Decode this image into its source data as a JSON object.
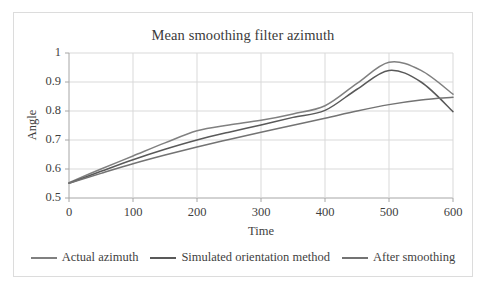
{
  "chart_data": {
    "type": "line",
    "title": "Mean smoothing filter azimuth",
    "xlabel": "Time",
    "ylabel": "Angle",
    "xlim": [
      0,
      600
    ],
    "ylim": [
      0.5,
      1
    ],
    "xticks": [
      "0",
      "100",
      "200",
      "300",
      "400",
      "500",
      "600"
    ],
    "yticks": [
      "0.5",
      "0.6",
      "0.7",
      "0.8",
      "0.9",
      "1"
    ],
    "grid": "horizontal-and-vertical",
    "legend_position": "bottom",
    "x": [
      0,
      50,
      100,
      150,
      200,
      250,
      300,
      350,
      400,
      450,
      500,
      550,
      600
    ],
    "series": [
      {
        "name": "Actual azimuth",
        "color": "#808080",
        "values": [
          0.553,
          0.6,
          0.645,
          0.69,
          0.732,
          0.752,
          0.768,
          0.79,
          0.818,
          0.895,
          0.968,
          0.94,
          0.858
        ]
      },
      {
        "name": "Simulated orientation method",
        "color": "#595959",
        "values": [
          0.551,
          0.592,
          0.632,
          0.668,
          0.7,
          0.727,
          0.752,
          0.778,
          0.802,
          0.875,
          0.94,
          0.9,
          0.798
        ]
      },
      {
        "name": "After smoothing",
        "color": "#737373",
        "values": [
          0.551,
          0.585,
          0.618,
          0.648,
          0.676,
          0.702,
          0.727,
          0.751,
          0.775,
          0.8,
          0.822,
          0.838,
          0.847
        ]
      }
    ]
  },
  "style": {
    "frame_border": "#dcdcdc",
    "grid_color": "#d9d9d9",
    "axis_color": "#a6a6a6",
    "text_color": "#3f3f3f"
  }
}
